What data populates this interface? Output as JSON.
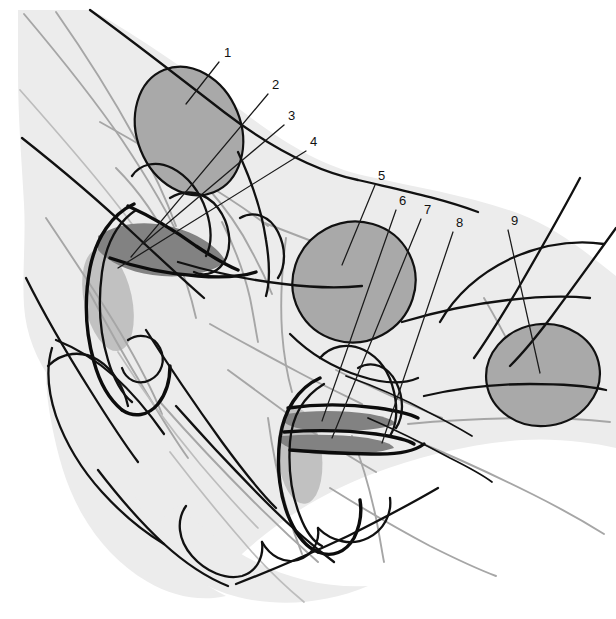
{
  "figure": {
    "kind": "anatomical-line-diagram",
    "width": 616,
    "height": 619,
    "background_color": "#ffffff",
    "tissue_color": "#ececec",
    "gland_color": "#a9a9a9",
    "lumen_color": "#828282",
    "outline_color": "#111111",
    "secondary_outline_color": "#a6a6a6",
    "label_color": "#111111"
  },
  "labels": [
    {
      "id": "1",
      "text": "1",
      "x": 224,
      "y": 57,
      "leader": {
        "x1": 219,
        "y1": 62,
        "x2": 186,
        "y2": 104
      }
    },
    {
      "id": "2",
      "text": "2",
      "x": 272,
      "y": 89,
      "leader": {
        "x1": 268,
        "y1": 94,
        "x2": 131,
        "y2": 257
      }
    },
    {
      "id": "3",
      "text": "3",
      "x": 288,
      "y": 120,
      "leader": {
        "x1": 284,
        "y1": 125,
        "x2": 143,
        "y2": 244
      }
    },
    {
      "id": "4",
      "text": "4",
      "x": 310,
      "y": 146,
      "leader": {
        "x1": 306,
        "y1": 151,
        "x2": 118,
        "y2": 268
      }
    },
    {
      "id": "5",
      "text": "5",
      "x": 378,
      "y": 180,
      "leader": {
        "x1": 375,
        "y1": 185,
        "x2": 342,
        "y2": 265
      }
    },
    {
      "id": "6",
      "text": "6",
      "x": 399,
      "y": 205,
      "leader": {
        "x1": 396,
        "y1": 210,
        "x2": 322,
        "y2": 421
      }
    },
    {
      "id": "7",
      "text": "7",
      "x": 424,
      "y": 214,
      "leader": {
        "x1": 421,
        "y1": 219,
        "x2": 332,
        "y2": 438
      }
    },
    {
      "id": "8",
      "text": "8",
      "x": 456,
      "y": 227,
      "leader": {
        "x1": 453,
        "y1": 232,
        "x2": 382,
        "y2": 443
      }
    },
    {
      "id": "9",
      "text": "9",
      "x": 511,
      "y": 225,
      "leader": {
        "x1": 508,
        "y1": 230,
        "x2": 540,
        "y2": 373
      }
    }
  ],
  "glands": [
    {
      "name": "gland-upper-left",
      "cx": 189,
      "cy": 131,
      "rx": 52,
      "ry": 66,
      "rotate": -22
    },
    {
      "name": "gland-center",
      "cx": 354,
      "cy": 282,
      "rx": 62,
      "ry": 60,
      "rotate": -28
    },
    {
      "name": "gland-right",
      "cx": 543,
      "cy": 375,
      "rx": 57,
      "ry": 51,
      "rotate": -8
    }
  ],
  "lumens": [
    {
      "name": "lumen-upper",
      "cx": 152,
      "cy": 247,
      "rx": 57,
      "ry": 26,
      "rotate": -11
    },
    {
      "name": "lumen-lower-upper",
      "cx": 338,
      "cy": 423,
      "rx": 58,
      "ry": 9,
      "rotate": 2
    },
    {
      "name": "lumen-lower-lower",
      "cx": 334,
      "cy": 443,
      "rx": 57,
      "ry": 8,
      "rotate": 2
    }
  ]
}
